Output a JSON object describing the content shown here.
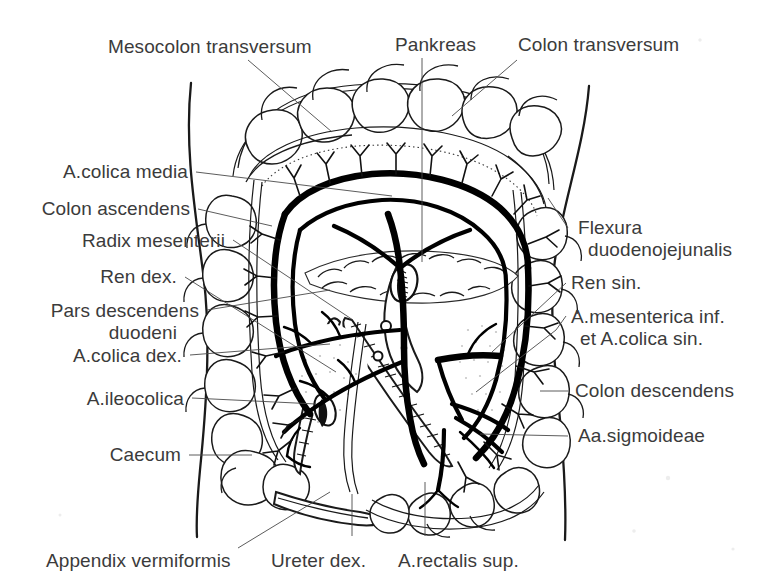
{
  "figure": {
    "background_color": "#ffffff",
    "ink_color": "#1a1a1a",
    "label_color": "#3b3b3b",
    "leader_color": "#4a4a4a"
  },
  "labels": {
    "mesocolon_transversum": "Mesocolon transversum",
    "pankreas": "Pankreas",
    "colon_transversum": "Colon transversum",
    "a_colica_media": "A.colica media",
    "colon_ascendens": "Colon ascendens",
    "radix_mesenterii": "Radix mesenterii",
    "ren_dex": "Ren dex.",
    "pars_descendens": "Pars descendens",
    "duodeni": "duodeni",
    "a_colica_dex": "A.colica dex.",
    "a_ileocolica": "A.ileocolica",
    "caecum": "Caecum",
    "flexura": "Flexura",
    "duodenojejunalis": "duodenojejunalis",
    "ren_sin": "Ren sin.",
    "a_mesenterica_inf": "A.mesenterica inf.",
    "et_a_colica_sin": "et A.colica sin.",
    "colon_descendens": "Colon descendens",
    "aa_sigmoideae": "Aa.sigmoideae",
    "appendix_vermiformis": "Appendix vermiformis",
    "ureter_dex": "Ureter dex.",
    "a_rectalis_sup": "A.rectalis sup."
  }
}
